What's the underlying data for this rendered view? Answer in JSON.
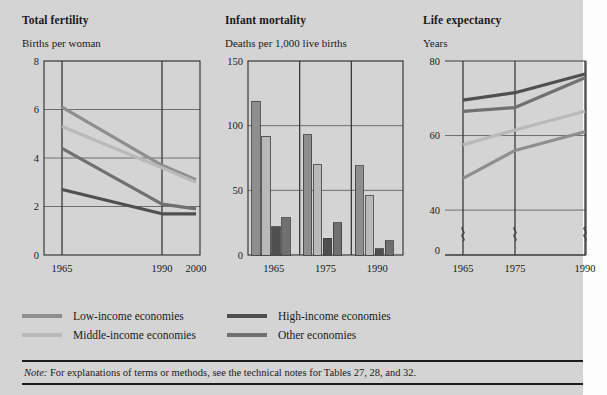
{
  "series_colors": {
    "low_income": "#8e8e8e",
    "middle_income": "#b9b9b9",
    "high_income": "#4f4f4f",
    "other": "#707070"
  },
  "legend": {
    "items": [
      {
        "key": "low_income",
        "label": "Low-income economies",
        "color": "#8e8e8e"
      },
      {
        "key": "high_income",
        "label": "High-income economies",
        "color": "#4f4f4f"
      },
      {
        "key": "middle_income",
        "label": "Middle-income economies",
        "color": "#b9b9b9"
      },
      {
        "key": "other",
        "label": "Other economies",
        "color": "#707070"
      }
    ]
  },
  "note": {
    "prefix": "Note:",
    "text": "For explanations of terms or methods, see the technical notes for Tables 27, 28, and 32."
  },
  "chart_data": [
    {
      "type": "line",
      "title": "Total fertility",
      "ylabel": "Births per woman",
      "xlabel": "",
      "x": [
        1965,
        1990,
        2000
      ],
      "xticks": [
        "1965",
        "1990",
        "2000"
      ],
      "ylim": [
        0,
        8
      ],
      "yticks": [
        0,
        2,
        4,
        6,
        8
      ],
      "ytick_labels": [
        "0",
        "2",
        "4",
        "6",
        "8"
      ],
      "grid": true,
      "legend_position": "below-figure",
      "series": [
        {
          "name": "Low-income economies",
          "color": "#8e8e8e",
          "values": [
            6.1,
            3.7,
            3.1
          ]
        },
        {
          "name": "Middle-income economies",
          "color": "#b9b9b9",
          "values": [
            5.3,
            3.6,
            3.0
          ]
        },
        {
          "name": "Other economies",
          "color": "#707070",
          "values": [
            4.4,
            2.1,
            1.9
          ]
        },
        {
          "name": "High-income economies",
          "color": "#4f4f4f",
          "values": [
            2.7,
            1.7,
            1.7
          ]
        }
      ]
    },
    {
      "type": "bar",
      "title": "Infant mortality",
      "ylabel": "Deaths per 1,000 live births",
      "xlabel": "",
      "categories": [
        "1965",
        "1975",
        "1990"
      ],
      "ylim": [
        0,
        150
      ],
      "yticks": [
        0,
        50,
        100,
        150
      ],
      "ytick_labels": [
        "0",
        "50",
        "100",
        "150"
      ],
      "grid": true,
      "legend_position": "below-figure",
      "series": [
        {
          "name": "Low-income economies",
          "color": "#8e8e8e",
          "values": [
            119,
            93,
            69
          ]
        },
        {
          "name": "Middle-income economies",
          "color": "#b9b9b9",
          "values": [
            92,
            70,
            46
          ]
        },
        {
          "name": "High-income economies",
          "color": "#4f4f4f",
          "values": [
            22,
            13,
            5
          ]
        },
        {
          "name": "Other economies",
          "color": "#707070",
          "values": [
            29,
            25,
            11
          ]
        }
      ]
    },
    {
      "type": "line",
      "title": "Life expectancy",
      "ylabel": "Years",
      "xlabel": "",
      "x": [
        1965,
        1975,
        1990
      ],
      "xticks": [
        "1965",
        "1975",
        "1990"
      ],
      "ylim": [
        36,
        80
      ],
      "yticks": [
        0,
        40,
        60,
        80
      ],
      "ytick_labels": [
        "0",
        "40",
        "60",
        "80"
      ],
      "axis_break": true,
      "grid": true,
      "legend_position": "below-figure",
      "series": [
        {
          "name": "High-income economies",
          "color": "#4f4f4f",
          "values": [
            69.5,
            71.5,
            76.5
          ]
        },
        {
          "name": "Other economies",
          "color": "#707070",
          "values": [
            66.5,
            67.5,
            75.5
          ]
        },
        {
          "name": "Middle-income economies",
          "color": "#b9b9b9",
          "values": [
            57.5,
            61.5,
            66.5
          ]
        },
        {
          "name": "Low-income economies",
          "color": "#8e8e8e",
          "values": [
            48.5,
            56.0,
            61.0
          ]
        }
      ]
    }
  ]
}
